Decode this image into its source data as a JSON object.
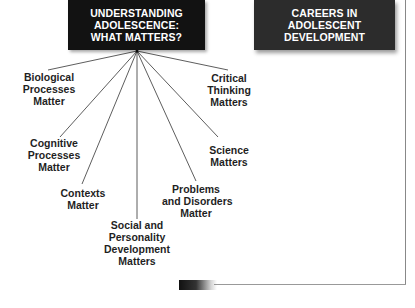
{
  "diagram": {
    "main_box": {
      "lines": [
        "UNDERSTANDING",
        "ADOLESCENCE:",
        "WHAT MATTERS?"
      ],
      "color": "#121212"
    },
    "careers_box": {
      "lines": [
        "CAREERS IN",
        "ADOLESCENT",
        "DEVELOPMENT"
      ],
      "color": "#2c2c2c"
    },
    "branches": [
      {
        "id": "biological",
        "lines": [
          "Biological",
          "Processes",
          "Matter"
        ]
      },
      {
        "id": "cognitive",
        "lines": [
          "Cognitive",
          "Processes",
          "Matter"
        ]
      },
      {
        "id": "contexts",
        "lines": [
          "Contexts",
          "Matter"
        ]
      },
      {
        "id": "social",
        "lines": [
          "Social and",
          "Personality",
          "Development",
          "Matters"
        ]
      },
      {
        "id": "problems",
        "lines": [
          "Problems",
          "and Disorders",
          "Matter"
        ]
      },
      {
        "id": "science",
        "lines": [
          "Science",
          "Matters"
        ]
      },
      {
        "id": "critical",
        "lines": [
          "Critical",
          "Thinking",
          "Matters"
        ]
      }
    ],
    "line_color": "#333333",
    "border_color": "#888888"
  }
}
